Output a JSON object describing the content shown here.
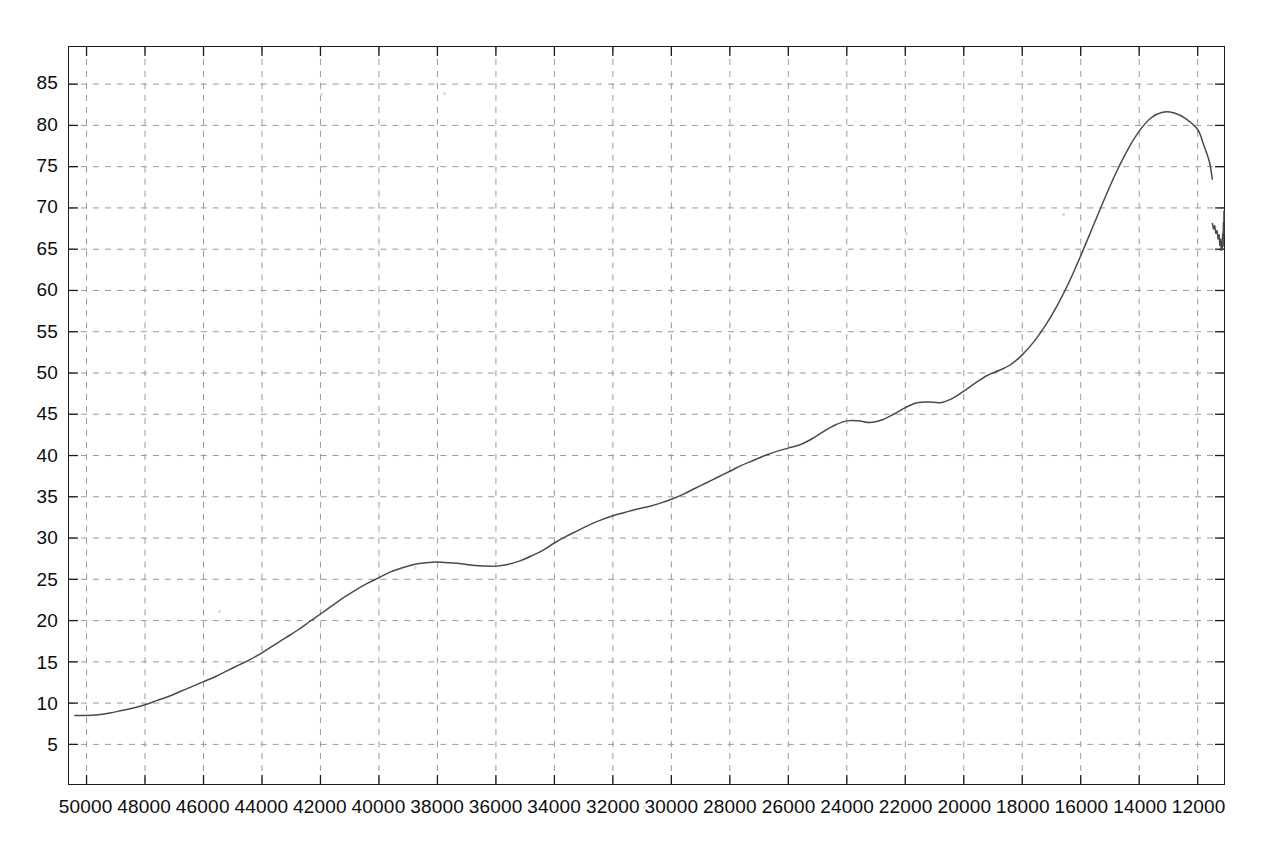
{
  "chart_data": {
    "type": "line",
    "title": "",
    "subtitle": "",
    "xlabel": "",
    "ylabel": "",
    "x_axis_reversed": true,
    "xlim": [
      50600,
      11100
    ],
    "ylim": [
      0.2,
      89.5
    ],
    "grid": true,
    "grid_style": "dashed",
    "legend": null,
    "legend_position": "none",
    "xticks": [
      50000,
      48000,
      46000,
      44000,
      42000,
      40000,
      38000,
      36000,
      34000,
      32000,
      30000,
      28000,
      26000,
      24000,
      22000,
      20000,
      18000,
      16000,
      14000,
      12000
    ],
    "xtick_labels": [
      "50000",
      "48000",
      "46000",
      "44000",
      "42000",
      "40000",
      "38000",
      "36000",
      "34000",
      "32000",
      "30000",
      "28000",
      "26000",
      "24000",
      "22000",
      "20000",
      "18000",
      "16000",
      "14000",
      "12000"
    ],
    "yticks": [
      5,
      10,
      15,
      20,
      25,
      30,
      35,
      40,
      45,
      50,
      55,
      60,
      65,
      70,
      75,
      80,
      85
    ],
    "ytick_labels": [
      "5",
      "10",
      "15",
      "20",
      "25",
      "30",
      "35",
      "40",
      "45",
      "50",
      "55",
      "60",
      "65",
      "70",
      "75",
      "80",
      "85"
    ],
    "series": [
      {
        "name": "curve",
        "color": "#4a4a4a",
        "line_width": 1.5,
        "x": [
          50400,
          50000,
          49600,
          49200,
          48800,
          48400,
          48000,
          47600,
          47200,
          46800,
          46400,
          46000,
          45600,
          45200,
          44800,
          44400,
          44000,
          43600,
          43200,
          42800,
          42400,
          42000,
          41600,
          41200,
          40800,
          40400,
          40000,
          39600,
          39200,
          38800,
          38400,
          38000,
          37600,
          37200,
          36800,
          36400,
          36000,
          35600,
          35200,
          34800,
          34400,
          34000,
          33600,
          33200,
          32800,
          32400,
          32000,
          31600,
          31200,
          30800,
          30400,
          30000,
          29600,
          29200,
          28800,
          28400,
          28000,
          27600,
          27200,
          26800,
          26400,
          26000,
          25600,
          25200,
          24800,
          24400,
          24000,
          23600,
          23200,
          22800,
          22400,
          22000,
          21600,
          21200,
          20800,
          20400,
          20000,
          19600,
          19200,
          18800,
          18400,
          18000,
          17600,
          17200,
          16800,
          16400,
          16000,
          15600,
          15200,
          14800,
          14400,
          14000,
          13600,
          13200,
          12800,
          12400,
          12000,
          11800,
          11600,
          11500,
          11400,
          11350,
          11300,
          11250,
          11200,
          11150,
          11100
        ],
        "y": [
          8.5,
          8.5,
          8.6,
          8.8,
          9.1,
          9.4,
          9.8,
          10.3,
          10.8,
          11.4,
          12.0,
          12.6,
          13.2,
          13.9,
          14.6,
          15.3,
          16.1,
          17.0,
          17.9,
          18.8,
          19.8,
          20.8,
          21.8,
          22.8,
          23.7,
          24.5,
          25.2,
          25.9,
          26.4,
          26.8,
          27.0,
          27.1,
          27.0,
          26.9,
          26.7,
          26.6,
          26.6,
          26.8,
          27.2,
          27.8,
          28.5,
          29.4,
          30.2,
          30.9,
          31.6,
          32.2,
          32.7,
          33.1,
          33.5,
          33.8,
          34.2,
          34.7,
          35.3,
          36.0,
          36.7,
          37.4,
          38.1,
          38.8,
          39.4,
          40.0,
          40.5,
          40.9,
          41.3,
          42.0,
          42.9,
          43.7,
          44.2,
          44.2,
          44.0,
          44.3,
          45.0,
          45.8,
          46.4,
          46.5,
          46.4,
          46.9,
          47.8,
          48.8,
          49.7,
          50.3,
          51.0,
          52.2,
          53.8,
          55.8,
          58.2,
          61.0,
          64.2,
          67.6,
          71.0,
          74.2,
          77.0,
          79.3,
          80.9,
          81.6,
          81.5,
          80.8,
          79.5,
          77.7,
          75.6,
          73.5,
          71.6,
          70.1,
          69.0,
          68.2,
          67.6,
          67.1,
          66.8
        ],
        "peak": {
          "x": 14800,
          "y": 81.6
        },
        "start": {
          "x": 50400,
          "y": 8.5
        },
        "end": {
          "x": 11100,
          "y": 66.8
        },
        "noise_tail": {
          "x": [
            11500,
            11460,
            11420,
            11380,
            11340,
            11300,
            11270,
            11240,
            11215,
            11195,
            11175,
            11160,
            11145,
            11130,
            11120,
            11110,
            11100
          ],
          "y": [
            68.2,
            67.4,
            67.9,
            66.9,
            67.3,
            66.2,
            66.8,
            65.4,
            66.3,
            64.8,
            66.0,
            64.9,
            66.9,
            65.3,
            68.3,
            66.4,
            69.7
          ]
        }
      }
    ]
  }
}
